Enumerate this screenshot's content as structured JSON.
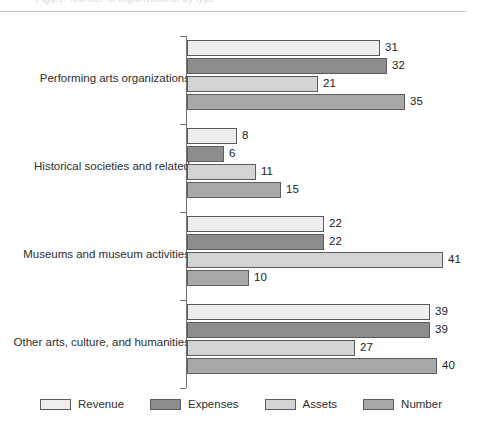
{
  "header": {
    "clipped_text": "Figure. Number of organizations, by type"
  },
  "chart_data": {
    "type": "bar",
    "orientation": "horizontal",
    "title": "",
    "subtitle": "",
    "xlabel": "",
    "ylabel": "",
    "grid": false,
    "legend_position": "bottom",
    "xlim": [
      0,
      45
    ],
    "categories": [
      "Performing arts organizations",
      "Historical societies and related",
      "Museums and museum activities",
      "Other arts, culture, and humanities"
    ],
    "series": [
      {
        "name": "Revenue",
        "color": "#eeeeee",
        "values": [
          31,
          8,
          22,
          39
        ]
      },
      {
        "name": "Expenses",
        "color": "#8c8c8c",
        "values": [
          32,
          6,
          22,
          39
        ]
      },
      {
        "name": "Assets",
        "color": "#d4d4d4",
        "values": [
          21,
          11,
          41,
          27
        ]
      },
      {
        "name": "Number",
        "color": "#a8a8a8",
        "values": [
          35,
          15,
          10,
          40
        ]
      }
    ]
  },
  "legend": {
    "items": [
      {
        "label": "Revenue",
        "color": "#eeeeee"
      },
      {
        "label": "Expenses",
        "color": "#8c8c8c"
      },
      {
        "label": "Assets",
        "color": "#d4d4d4"
      },
      {
        "label": "Number",
        "color": "#a8a8a8"
      }
    ]
  },
  "style": {
    "bar_border": "#595d60",
    "axis_color": "#6e7275",
    "rule_color": "#c3c6c8",
    "text_color": "#2e2e2e"
  }
}
